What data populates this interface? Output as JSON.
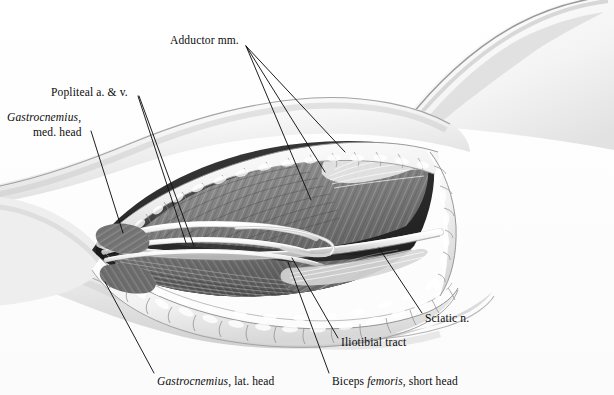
{
  "figure": {
    "medium": "grayscale anatomical illustration",
    "background_color": "#fdfdfd",
    "ink_color": "#0b0b0b",
    "width": 614,
    "height": 395
  },
  "labels": {
    "adductor": {
      "text": "Adductor mm.",
      "leader_count": 3
    },
    "popliteal": {
      "text": "Popliteal a. & v.",
      "leader_count": 2
    },
    "gastroc_med_line1": "Gastrocnemius,",
    "gastroc_med_line2": "med. head",
    "sciatic": {
      "text": "Sciatic n.",
      "leader_count": 1
    },
    "iliotibial": {
      "text": "Iliotibial tract",
      "leader_count": 1
    },
    "gastroc_lat_pre": "Gastrocnemius",
    "gastroc_lat_post": ", lat. head",
    "biceps_pre": "Biceps ",
    "biceps_italic": "femoris",
    "biceps_post": ", short head"
  },
  "structures": {
    "skin_surface": "skin and gluteal contour",
    "subcutaneous_fat": "lobulated subcutaneous fat margin",
    "hamstring_muscles": "striated hamstring muscle bellies",
    "adductor_muscles": "adductor muscle mass",
    "popliteal_vessels": "popliteal artery and vein",
    "sciatic_nerve": "sciatic nerve cord",
    "iliotibial_tract": "iliotibial tract band",
    "gastrocnemius_heads": "medial and lateral gastrocnemius heads"
  }
}
